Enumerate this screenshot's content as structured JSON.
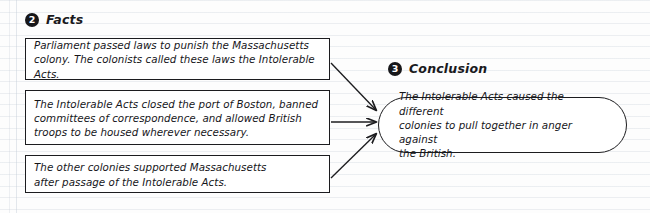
{
  "page": {
    "background_color": "#fdfdfd",
    "rule_color": "#c4ccd6",
    "ink_color": "#16161a"
  },
  "sections": {
    "facts": {
      "number": "2",
      "title": "Facts"
    },
    "conclusion": {
      "number": "3",
      "title": "Conclusion"
    }
  },
  "facts": [
    {
      "id": "fact-1",
      "text": "Parliament passed laws to punish the Massachusetts\ncolony. The colonists called these laws the Intolerable Acts."
    },
    {
      "id": "fact-2",
      "text": "The Intolerable Acts closed the port of Boston, banned\ncommittees of correspondence, and allowed British\ntroops to be housed wherever necessary."
    },
    {
      "id": "fact-3",
      "text": "The other colonies supported Massachusetts\nafter passage of the Intolerable Acts."
    }
  ],
  "conclusion": {
    "text": "The Intolerable Acts caused the different\ncolonies to pull together in anger against\nthe British."
  },
  "arrows": [
    {
      "id": "arrow-fact-1-to-conclusion",
      "from": "fact-1",
      "to": "conclusion"
    },
    {
      "id": "arrow-fact-2-to-conclusion",
      "from": "fact-2",
      "to": "conclusion"
    },
    {
      "id": "arrow-fact-3-to-conclusion",
      "from": "fact-3",
      "to": "conclusion"
    }
  ]
}
